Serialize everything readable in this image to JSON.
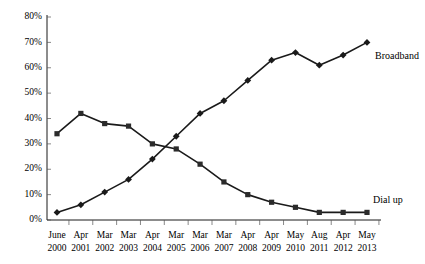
{
  "chart_data": {
    "type": "line",
    "title": "",
    "xlabel": "",
    "ylabel": "",
    "ylim": [
      0,
      80
    ],
    "ytick_labels": [
      "0%",
      "10%",
      "20%",
      "30%",
      "40%",
      "50%",
      "60%",
      "70%",
      "80%"
    ],
    "ytick_values": [
      0,
      10,
      20,
      30,
      40,
      50,
      60,
      70,
      80
    ],
    "grid": false,
    "legend_position": "inline-right",
    "categories": [
      "June 2000",
      "Apr 2001",
      "Mar 2002",
      "Mar 2003",
      "Apr 2004",
      "Mar 2005",
      "Mar 2006",
      "Mar 2007",
      "Apr 2008",
      "Apr 2009",
      "May 2010",
      "Aug 2011",
      "Apr 2012",
      "May 2013"
    ],
    "xtick_labels_line1": [
      "June",
      "Apr",
      "Mar",
      "Mar",
      "Apr",
      "Mar",
      "Mar",
      "Mar",
      "Apr",
      "Apr",
      "May",
      "Aug",
      "Apr",
      "May"
    ],
    "xtick_labels_line2": [
      "2000",
      "2001",
      "2002",
      "2003",
      "2004",
      "2005",
      "2006",
      "2007",
      "2008",
      "2009",
      "2010",
      "2011",
      "2012",
      "2013"
    ],
    "series": [
      {
        "name": "Broadband",
        "marker": "diamond",
        "color": "#1a1a1a",
        "values": [
          3,
          6,
          11,
          16,
          24,
          33,
          42,
          47,
          55,
          63,
          66,
          61,
          65,
          70
        ]
      },
      {
        "name": "Dial up",
        "marker": "square",
        "color": "#2b2b2b",
        "values": [
          34,
          42,
          38,
          37,
          30,
          28,
          22,
          15,
          10,
          7,
          5,
          3,
          3,
          3
        ]
      }
    ],
    "annotations": [
      {
        "text": "Broadband",
        "series": "Broadband",
        "at_category": "May 2013"
      },
      {
        "text": "Dial up",
        "series": "Dial up",
        "at_category": "May 2013"
      }
    ]
  }
}
